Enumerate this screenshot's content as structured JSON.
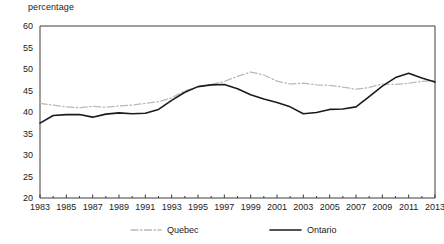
{
  "chart_data": {
    "type": "line",
    "title": "",
    "ylabel": "percentage",
    "xlabel": "",
    "ylim": [
      20,
      60
    ],
    "yticks": [
      20,
      25,
      30,
      35,
      40,
      45,
      50,
      55,
      60
    ],
    "ytick_labels": [
      "20",
      "25",
      "30",
      "35",
      "40",
      "45",
      "50",
      "55",
      "60"
    ],
    "xlim": [
      1983,
      2013
    ],
    "xticks": [
      1983,
      1985,
      1987,
      1989,
      1991,
      1993,
      1995,
      1997,
      1999,
      2001,
      2003,
      2005,
      2007,
      2009,
      2011,
      2013
    ],
    "xtick_labels": [
      "1983",
      "1985",
      "1987",
      "1989",
      "1991",
      "1993",
      "1995",
      "1997",
      "1999",
      "2001",
      "2003",
      "2005",
      "2007",
      "2009",
      "2011",
      "2013"
    ],
    "x": [
      1983,
      1984,
      1985,
      1986,
      1987,
      1988,
      1989,
      1990,
      1991,
      1992,
      1993,
      1994,
      1995,
      1996,
      1997,
      1998,
      1999,
      2000,
      2001,
      2002,
      2003,
      2004,
      2005,
      2006,
      2007,
      2008,
      2009,
      2010,
      2011,
      2012,
      2013
    ],
    "grid": false,
    "legend_position": "bottom",
    "series": [
      {
        "name": "Quebec",
        "style": "dash-dot",
        "color": "#b9b9b9",
        "values": [
          42.0,
          41.6,
          41.2,
          41.0,
          41.3,
          41.1,
          41.4,
          41.6,
          42.0,
          42.4,
          43.3,
          44.9,
          45.9,
          46.4,
          47.1,
          48.3,
          49.3,
          48.6,
          47.2,
          46.5,
          46.7,
          46.3,
          46.2,
          45.8,
          45.3,
          45.7,
          46.5,
          46.4,
          46.7,
          47.1,
          47.3
        ]
      },
      {
        "name": "Ontario",
        "style": "solid",
        "color": "#1b1b1b",
        "values": [
          37.4,
          39.2,
          39.4,
          39.4,
          38.8,
          39.5,
          39.8,
          39.6,
          39.7,
          40.6,
          42.7,
          44.6,
          45.9,
          46.3,
          46.4,
          45.4,
          44.0,
          43.0,
          42.2,
          41.2,
          39.6,
          39.9,
          40.6,
          40.7,
          41.2,
          43.6,
          46.0,
          48.0,
          49.0,
          47.9,
          47.0
        ]
      }
    ],
    "legend": [
      {
        "label": "Quebec",
        "style": "dash-dot",
        "color": "#b9b9b9"
      },
      {
        "label": "Ontario",
        "style": "solid",
        "color": "#1b1b1b"
      }
    ]
  }
}
